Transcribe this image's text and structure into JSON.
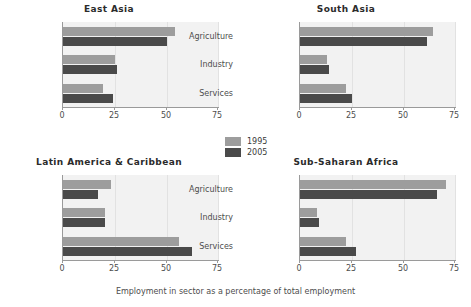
{
  "chart_data": {
    "type": "bar",
    "orientation": "horizontal",
    "title": "",
    "xlabel": "Employment in sector as a percentage of total employment",
    "ylabel": "",
    "xlim": [
      0,
      75
    ],
    "xticks": [
      0,
      25,
      50,
      75
    ],
    "grid": true,
    "legend_position": "center",
    "categories": [
      "Agriculture",
      "Industry",
      "Services"
    ],
    "series_names": [
      "1995",
      "2005"
    ],
    "panels": [
      {
        "title": "East Asia",
        "series": [
          {
            "name": "1995",
            "values": [
              54,
              25,
              19
            ]
          },
          {
            "name": "2005",
            "values": [
              50,
              26,
              24
            ]
          }
        ]
      },
      {
        "title": "South Asia",
        "series": [
          {
            "name": "1995",
            "values": [
              64,
              13,
              22
            ]
          },
          {
            "name": "2005",
            "values": [
              61,
              14,
              25
            ]
          }
        ]
      },
      {
        "title": "Latin America & Caribbean",
        "series": [
          {
            "name": "1995",
            "values": [
              23,
              20,
              56
            ]
          },
          {
            "name": "2005",
            "values": [
              17,
              20,
              62
            ]
          }
        ]
      },
      {
        "title": "Sub-Saharan Africa",
        "series": [
          {
            "name": "1995",
            "values": [
              70,
              8,
              22
            ]
          },
          {
            "name": "2005",
            "values": [
              66,
              9,
              27
            ]
          }
        ]
      }
    ],
    "colors": {
      "series_1995": "#9d9d9d",
      "series_2005": "#4a4a4a",
      "plot_background": "#f2f2f2",
      "gridline": "#e2e2e2",
      "axis": "#9a9a9a",
      "text": "#3a3a3a",
      "figure_background": "#ffffff"
    }
  },
  "legend": {
    "items": [
      {
        "label": "1995",
        "color": "#9d9d9d"
      },
      {
        "label": "2005",
        "color": "#4a4a4a"
      }
    ]
  },
  "axis": {
    "caption": "Employment in sector as a percentage of total employment",
    "tick_labels": [
      "0",
      "25",
      "50",
      "75"
    ]
  }
}
